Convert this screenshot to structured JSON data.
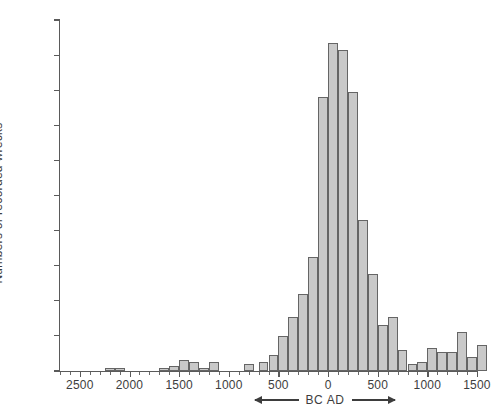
{
  "chart_data": {
    "type": "bar",
    "title": "",
    "subtitle": "",
    "xlabel": "BC AD",
    "ylabel": "Numbers of recorded wrecks",
    "xlim": [
      -2700,
      1500
    ],
    "ylim": [
      0,
      200
    ],
    "grid": false,
    "legend": null,
    "bar_color": "#c9c9c9",
    "bar_edge_color": "#656565",
    "axis_color": "#5a5a5a",
    "text_color": "#3d3d3d",
    "y_ticks": [
      0,
      20,
      40,
      60,
      80,
      100,
      120,
      140,
      160,
      180,
      200
    ],
    "y_tick_labels": [
      "0",
      "20",
      "40",
      "60",
      "80",
      "100",
      "120",
      "140",
      "160",
      "180",
      "200"
    ],
    "x_ticks": [
      -2500,
      -2000,
      -1500,
      -1000,
      -500,
      0,
      500,
      1000,
      1500
    ],
    "x_tick_labels": [
      "2500",
      "2000",
      "1500",
      "1000",
      "500",
      "0",
      "500",
      "1000",
      "1500"
    ],
    "x_minor_step": 100,
    "era_annotation": {
      "label": "BC  AD",
      "left_arrow": true,
      "right_arrow": true,
      "note": "left arrow points toward BC (older), right arrow points toward AD"
    },
    "bin_width": 100,
    "bins": [
      {
        "start": -2700,
        "end": -2600,
        "value": 0
      },
      {
        "start": -2600,
        "end": -2500,
        "value": 0
      },
      {
        "start": -2500,
        "end": -2400,
        "value": 0
      },
      {
        "start": -2400,
        "end": -2300,
        "value": 0
      },
      {
        "start": -2300,
        "end": -2200,
        "value": 0
      },
      {
        "start": -2200,
        "end": -2100,
        "value": 2
      },
      {
        "start": -2100,
        "end": -2000,
        "value": 2
      },
      {
        "start": -2000,
        "end": -1900,
        "value": 0
      },
      {
        "start": -1900,
        "end": -1800,
        "value": 0
      },
      {
        "start": -1800,
        "end": -1700,
        "value": 0
      },
      {
        "start": -1700,
        "end": -1600,
        "value": 2
      },
      {
        "start": -1600,
        "end": -1500,
        "value": 3
      },
      {
        "start": -1500,
        "end": -1400,
        "value": 6
      },
      {
        "start": -1400,
        "end": -1300,
        "value": 5
      },
      {
        "start": -1300,
        "end": -1200,
        "value": 2
      },
      {
        "start": -1200,
        "end": -1100,
        "value": 5
      },
      {
        "start": -1100,
        "end": -1000,
        "value": 0
      },
      {
        "start": -1000,
        "end": -900,
        "value": 0
      },
      {
        "start": -900,
        "end": -800,
        "value": 4
      },
      {
        "start": -800,
        "end": -700,
        "value": 0
      },
      {
        "start": -700,
        "end": -600,
        "value": 0
      },
      {
        "start": -600,
        "end": -500,
        "value": 0
      },
      {
        "start": -500,
        "end": -400,
        "value": 0
      },
      {
        "start": -400,
        "end": -300,
        "value": 0
      },
      {
        "start": -700,
        "end": -650,
        "value": 0
      },
      {
        "start": -650,
        "end": -600,
        "value": 9
      },
      {
        "start": -600,
        "end": -550,
        "value": 5
      },
      {
        "start": -550,
        "end": -500,
        "value": 20
      },
      {
        "start": -500,
        "end": -450,
        "value": 31
      },
      {
        "start": -450,
        "end": -400,
        "value": 44
      },
      {
        "start": -400,
        "end": -350,
        "value": 65
      },
      {
        "start": -350,
        "end": -300,
        "value": 156
      },
      {
        "start": -300,
        "end": -250,
        "value": 187
      },
      {
        "start": -250,
        "end": -200,
        "value": 183
      },
      {
        "start": -200,
        "end": -150,
        "value": 159
      },
      {
        "start": -150,
        "end": -100,
        "value": 86
      },
      {
        "start": -100,
        "end": -50,
        "value": 55
      },
      {
        "start": -50,
        "end": 0,
        "value": 26
      },
      {
        "start": 0,
        "end": 50,
        "value": 31
      },
      {
        "start": 50,
        "end": 100,
        "value": 12
      },
      {
        "start": 100,
        "end": 150,
        "value": 4
      },
      {
        "start": 150,
        "end": 200,
        "value": 5
      },
      {
        "start": 200,
        "end": 250,
        "value": 13
      },
      {
        "start": 250,
        "end": 300,
        "value": 11
      },
      {
        "start": 300,
        "end": 350,
        "value": 11
      },
      {
        "start": 350,
        "end": 400,
        "value": 22
      },
      {
        "start": 400,
        "end": 450,
        "value": 8
      },
      {
        "start": 450,
        "end": 500,
        "value": 15
      }
    ],
    "bars": [
      {
        "x0": -2250,
        "x1": -2150,
        "value": 2
      },
      {
        "x0": -2150,
        "x1": -2050,
        "value": 2
      },
      {
        "x0": -1700,
        "x1": -1600,
        "value": 2
      },
      {
        "x0": -1600,
        "x1": -1500,
        "value": 3
      },
      {
        "x0": -1500,
        "x1": -1400,
        "value": 6
      },
      {
        "x0": -1400,
        "x1": -1300,
        "value": 5
      },
      {
        "x0": -1300,
        "x1": -1200,
        "value": 2
      },
      {
        "x0": -1200,
        "x1": -1100,
        "value": 5
      },
      {
        "x0": -850,
        "x1": -750,
        "value": 4
      },
      {
        "x0": -700,
        "x1": -600,
        "value": 5
      },
      {
        "x0": -600,
        "x1": -500,
        "value": 9
      },
      {
        "x0": -500,
        "x1": -400,
        "value": 20
      },
      {
        "x0": -400,
        "x1": -300,
        "value": 31
      },
      {
        "x0": -300,
        "x1": -200,
        "value": 44
      },
      {
        "x0": -200,
        "x1": -100,
        "value": 65
      },
      {
        "x0": -100,
        "x1": 0,
        "value": 156
      },
      {
        "x0": 0,
        "x1": 100,
        "value": 187
      },
      {
        "x0": 100,
        "x1": 200,
        "value": 183
      },
      {
        "x0": 200,
        "x1": 300,
        "value": 159
      },
      {
        "x0": 300,
        "x1": 400,
        "value": 86
      },
      {
        "x0": 400,
        "x1": 500,
        "value": 55
      },
      {
        "x0": 500,
        "x1": 600,
        "value": 26
      },
      {
        "x0": 600,
        "x1": 700,
        "value": 31
      },
      {
        "x0": 700,
        "x1": 800,
        "value": 12
      },
      {
        "x0": 800,
        "x1": 900,
        "value": 4
      },
      {
        "x0": 900,
        "x1": 1000,
        "value": 5
      },
      {
        "x0": 1000,
        "x1": 1100,
        "value": 13
      },
      {
        "x0": 1100,
        "x1": 1200,
        "value": 11
      },
      {
        "x0": 1200,
        "x1": 1300,
        "value": 11
      },
      {
        "x0": 1300,
        "x1": 1400,
        "value": 22
      },
      {
        "x0": 1400,
        "x1": 1500,
        "value": 8
      },
      {
        "x0": 1500,
        "x1": 1600,
        "value": 15
      }
    ]
  }
}
